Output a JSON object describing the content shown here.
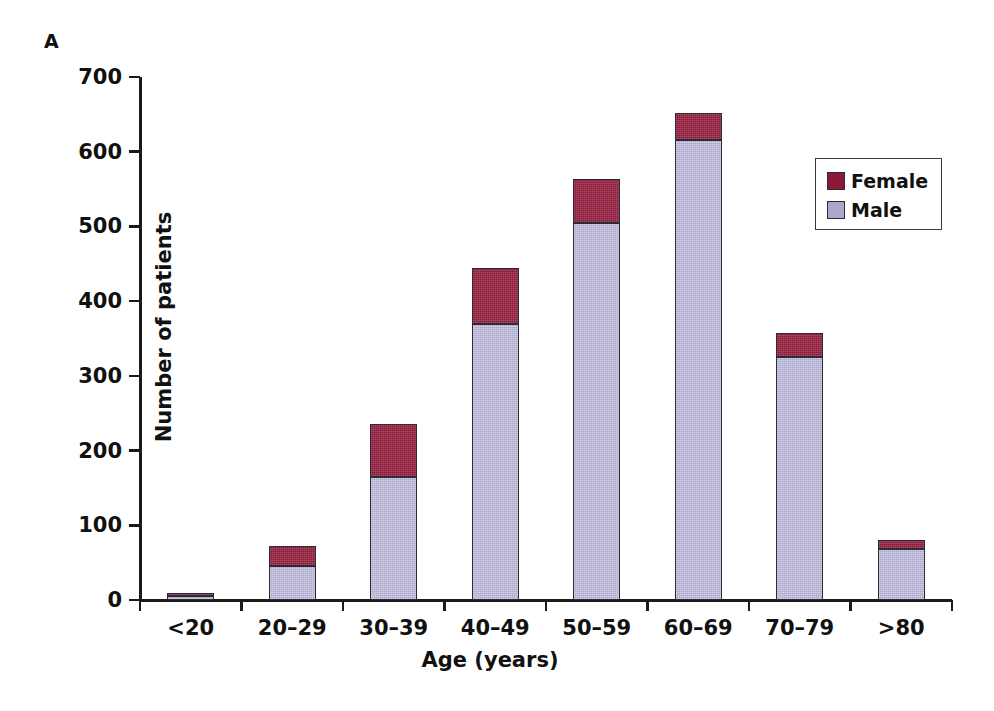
{
  "panel": {
    "label": "A"
  },
  "chart_data": {
    "type": "bar",
    "stacked": true,
    "title": "",
    "xlabel": "Age (years)",
    "ylabel": "Number of patients",
    "ylim": [
      0,
      700
    ],
    "ytick_values": [
      0,
      100,
      200,
      300,
      400,
      500,
      600,
      700
    ],
    "ytick_labels": [
      "0",
      "100",
      "200",
      "300",
      "400",
      "500",
      "600",
      "700"
    ],
    "grid": false,
    "legend_position": "top-right",
    "categories": [
      "<20",
      "20–29",
      "30–39",
      "40–49",
      "50–59",
      "60–69",
      "70–79",
      ">80"
    ],
    "series": [
      {
        "name": "Male",
        "color": "#aba6cc",
        "values": [
          6,
          45,
          165,
          370,
          505,
          616,
          325,
          68
        ]
      },
      {
        "name": "Female",
        "color": "#8e1838",
        "values": [
          3,
          27,
          71,
          74,
          58,
          36,
          32,
          13
        ]
      }
    ],
    "totals": [
      9,
      72,
      236,
      444,
      563,
      652,
      357,
      81
    ],
    "legend": [
      {
        "label": "Female",
        "color": "#8e1838",
        "swatch": "female-swatch"
      },
      {
        "label": "Male",
        "color": "#aba6cc",
        "swatch": "male-swatch"
      }
    ]
  }
}
